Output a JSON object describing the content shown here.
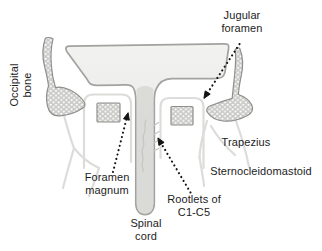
{
  "figure": {
    "labels": {
      "jugular_foramen": "Jugular\nforamen",
      "occipital_bone": "Occipital\nbone",
      "trapezius": "Trapezius",
      "sternocleidomastoid": "Sternocleidomastoid",
      "foramen_magnum": "Foramen\nmagnum",
      "rootlets": "Rootlets of\nC1-C5",
      "spinal_cord": "Spinal\ncord"
    },
    "colors": {
      "background": "#ffffff",
      "skull_fill_top": "#f2f2f0",
      "skull_fill_bottom": "#e3e3e1",
      "skull_outline": "#a2a2a0",
      "spinal_cord_fill": "#d8d8d6",
      "bone_section_fill": "#c9c9c7",
      "bone_section_dots": "#ffffff",
      "bone_section_outline": "#8f8f8d",
      "muscle_outline": "#dcdcda",
      "annotation_arrow": "#141414",
      "label_text": "#1c1c1c"
    }
  }
}
